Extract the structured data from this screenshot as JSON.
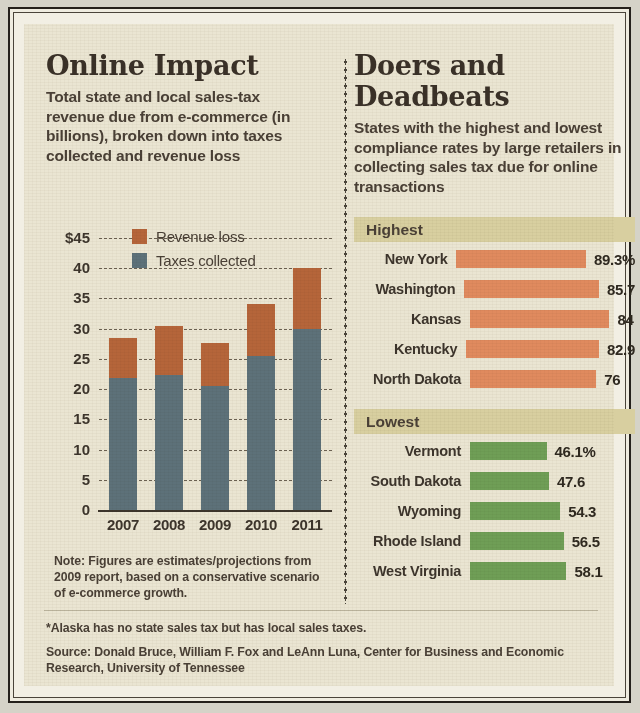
{
  "left_panel": {
    "headline": "Online Impact",
    "subhead": "Total state and local sales-tax revenue due from e-commerce (in billions), broken down into taxes collected and revenue loss",
    "note": "Note: Figures are estimates/projections from 2009 report, based on a conservative scenario of e-commerce growth."
  },
  "right_panel": {
    "headline": "Doers and Deadbeats",
    "subhead": "States with the highest and lowest compliance rates by large retailers in collecting sales tax due for online transactions",
    "highest_band": "Highest",
    "lowest_band": "Lowest"
  },
  "footer": {
    "footnote": "*Alaska has no state sales tax but has local sales taxes.",
    "source": "Source: Donald Bruce, William F. Fox and LeAnn Luna, Center for Business and Economic Research, University of Tennessee"
  },
  "colors": {
    "revenue_loss": "#b5653a",
    "taxes_collected": "#5d7179",
    "highest_bar": "#e08a5e",
    "lowest_bar": "#6f9e56",
    "band": "#d8cfa0",
    "paper": "#eae5d2",
    "ink": "#3d352c"
  },
  "chart_data": [
    {
      "type": "bar",
      "title": "Online Impact",
      "subtitle": "Total state and local sales-tax revenue due from e-commerce (in billions), broken down into taxes collected and revenue loss",
      "stacked": true,
      "xlabel": "",
      "ylabel": "",
      "categories": [
        "2007",
        "2008",
        "2009",
        "2010",
        "2011"
      ],
      "ytick_labels": [
        "$45",
        "40",
        "35",
        "30",
        "25",
        "20",
        "15",
        "10",
        "5",
        "0"
      ],
      "ytick_values": [
        45,
        40,
        35,
        30,
        25,
        20,
        15,
        10,
        5,
        0
      ],
      "ylim": [
        0,
        45
      ],
      "grid": true,
      "legend": [
        "Revenue loss",
        "Taxes collected"
      ],
      "legend_position": "upper-left-inside",
      "series": [
        {
          "name": "Taxes collected",
          "color": "#5d7179",
          "values": [
            21.8,
            22.4,
            20.5,
            25.4,
            30.0
          ]
        },
        {
          "name": "Revenue loss",
          "color": "#b5653a",
          "values": [
            6.7,
            8.1,
            7.2,
            8.6,
            10.0
          ]
        }
      ],
      "totals": [
        28.5,
        30.5,
        27.7,
        34.0,
        40.0
      ],
      "annotation": "Note: Figures are estimates/projections from 2009 report, based on a conservative scenario of e-commerce growth."
    },
    {
      "type": "bar",
      "orientation": "horizontal",
      "title": "Doers and Deadbeats",
      "subtitle": "States with the highest and lowest compliance rates by large retailers in collecting sales tax due for online transactions",
      "section": "Highest",
      "xlabel": "Compliance rate (%)",
      "ylabel": "",
      "grid": false,
      "legend_position": "none",
      "categories": [
        "New York",
        "Washington",
        "Kansas",
        "Kentucky",
        "North Dakota"
      ],
      "values": [
        89.3,
        85.7,
        84,
        82.9,
        76
      ],
      "value_labels": [
        "89.3%",
        "85.7",
        "84",
        "82.9",
        "76"
      ],
      "color": "#e08a5e",
      "xlim": [
        0,
        100
      ]
    },
    {
      "type": "bar",
      "orientation": "horizontal",
      "title": "Doers and Deadbeats",
      "section": "Lowest",
      "xlabel": "Compliance rate (%)",
      "ylabel": "",
      "grid": false,
      "legend_position": "none",
      "categories": [
        "Vermont",
        "South Dakota",
        "Wyoming",
        "Rhode Island",
        "West Virginia"
      ],
      "values": [
        46.1,
        47.6,
        54.3,
        56.5,
        58.1
      ],
      "value_labels": [
        "46.1%",
        "47.6",
        "54.3",
        "56.5",
        "58.1"
      ],
      "color": "#6f9e56",
      "xlim": [
        0,
        100
      ]
    }
  ]
}
